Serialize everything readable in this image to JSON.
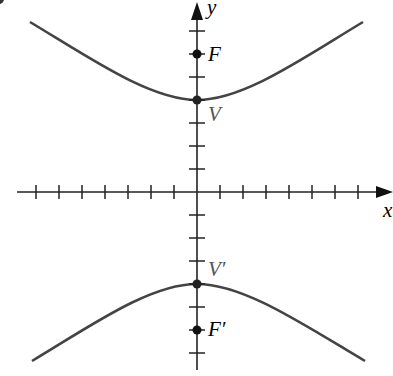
{
  "diagram": {
    "title": "",
    "type": "hyperbola-vertical-transverse-axis",
    "axes": {
      "x_label": "x",
      "y_label": "y",
      "tick_spacing_px": 23,
      "x_ticks_each_side": 7,
      "y_ticks_each_side": 7
    },
    "points": [
      {
        "id": "F",
        "label": "F",
        "y_units": 6
      },
      {
        "id": "V",
        "label": "V",
        "y_units": 4
      },
      {
        "id": "V_prime",
        "label": "V′",
        "y_units": -4
      },
      {
        "id": "F_prime",
        "label": "F′",
        "y_units": -6
      }
    ],
    "branches": [
      "upper",
      "lower"
    ],
    "colors": {
      "curve": "#444444",
      "axis": "#222222",
      "point": "#111111"
    }
  }
}
